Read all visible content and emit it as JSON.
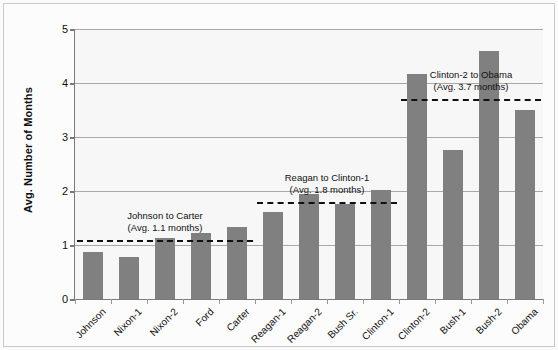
{
  "chart_data": {
    "type": "bar",
    "title": "",
    "xlabel": "",
    "ylabel": "Avg. Number of Months",
    "ylim": [
      0,
      5
    ],
    "ytick_labels": [
      "0",
      "1",
      "2",
      "3",
      "4",
      "5"
    ],
    "ytick_values": [
      0,
      1,
      2,
      3,
      4,
      5
    ],
    "grid": true,
    "legend": "none",
    "categories": [
      "Johnson",
      "Nixon-1",
      "Nixon-2",
      "Ford",
      "Carter",
      "Reagan-1",
      "Reagan-2",
      "Bush Sr.",
      "Clinton-1",
      "Clinton-2",
      "Bush-1",
      "Bush-2",
      "Obama"
    ],
    "values": [
      0.87,
      0.78,
      1.13,
      1.22,
      1.33,
      1.61,
      1.95,
      1.76,
      2.02,
      4.17,
      2.76,
      4.59,
      3.5
    ],
    "bar_color": "#808080",
    "plot_background": "#f7f7f7",
    "gridline_color": "#a8a8a8",
    "axis_color": "#7a7a7a",
    "annotations": [
      {
        "id": "johnson-to-carter",
        "line1": "Johnson to Carter",
        "line2": "(Avg. 1.1 months)",
        "value": 1.1,
        "span_from": "Johnson",
        "span_to": "Carter"
      },
      {
        "id": "reagan-to-clinton-1",
        "line1": "Reagan to Clinton-1",
        "line2": "(Avg. 1.8 months)",
        "value": 1.8,
        "span_from": "Reagan-1",
        "span_to": "Clinton-1"
      },
      {
        "id": "clinton-2-to-obama",
        "line1": "Clinton-2 to Obama",
        "line2": "(Avg. 3.7 months)",
        "value": 3.7,
        "span_from": "Clinton-2",
        "span_to": "Obama"
      }
    ]
  }
}
